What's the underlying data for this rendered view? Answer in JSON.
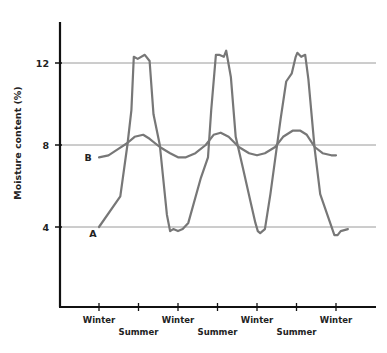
{
  "chart_data": {
    "type": "line",
    "title": "",
    "xlabel": "",
    "ylabel": "Moisture content (%)",
    "ylim": [
      0,
      14
    ],
    "yticks": [
      4,
      8,
      12
    ],
    "grid": "horizontal at y ticks",
    "x_unit": "season index (0 = Winter, 0.5 = Summer)",
    "xlim": [
      0,
      3.5
    ],
    "xticks": [
      {
        "x": 0,
        "label": "Winter",
        "row": 1
      },
      {
        "x": 0.5,
        "label": "Summer",
        "row": 2
      },
      {
        "x": 1,
        "label": "Winter",
        "row": 1
      },
      {
        "x": 1.5,
        "label": "Summer",
        "row": 2
      },
      {
        "x": 2,
        "label": "Winter",
        "row": 1
      },
      {
        "x": 2.5,
        "label": "Summer",
        "row": 2
      },
      {
        "x": 3,
        "label": "Winter",
        "row": 1
      }
    ],
    "series": [
      {
        "name": "A",
        "color": "#777777",
        "points": [
          [
            0.0,
            4.0
          ],
          [
            0.27,
            5.5
          ],
          [
            0.36,
            8.0
          ],
          [
            0.41,
            9.7
          ],
          [
            0.44,
            12.3
          ],
          [
            0.49,
            12.2
          ],
          [
            0.58,
            12.4
          ],
          [
            0.64,
            12.1
          ],
          [
            0.69,
            9.5
          ],
          [
            0.77,
            8.0
          ],
          [
            0.86,
            4.6
          ],
          [
            0.9,
            3.8
          ],
          [
            0.94,
            3.9
          ],
          [
            1.0,
            3.8
          ],
          [
            1.06,
            3.9
          ],
          [
            1.13,
            4.2
          ],
          [
            1.29,
            6.4
          ],
          [
            1.38,
            7.4
          ],
          [
            1.42,
            9.7
          ],
          [
            1.48,
            12.4
          ],
          [
            1.52,
            12.4
          ],
          [
            1.58,
            12.3
          ],
          [
            1.61,
            12.6
          ],
          [
            1.67,
            11.3
          ],
          [
            1.73,
            8.4
          ],
          [
            1.82,
            6.9
          ],
          [
            1.92,
            5.2
          ],
          [
            1.98,
            4.2
          ],
          [
            2.01,
            3.8
          ],
          [
            2.04,
            3.7
          ],
          [
            2.1,
            3.9
          ],
          [
            2.17,
            5.6
          ],
          [
            2.3,
            9.3
          ],
          [
            2.37,
            11.1
          ],
          [
            2.44,
            11.5
          ],
          [
            2.49,
            12.3
          ],
          [
            2.51,
            12.5
          ],
          [
            2.56,
            12.3
          ],
          [
            2.61,
            12.4
          ],
          [
            2.65,
            11.2
          ],
          [
            2.73,
            7.8
          ],
          [
            2.8,
            5.6
          ],
          [
            2.89,
            4.6
          ],
          [
            2.98,
            3.6
          ],
          [
            3.02,
            3.6
          ],
          [
            3.06,
            3.8
          ],
          [
            3.15,
            3.9
          ]
        ]
      },
      {
        "name": "B",
        "color": "#777777",
        "points": [
          [
            0.0,
            7.4
          ],
          [
            0.12,
            7.5
          ],
          [
            0.24,
            7.8
          ],
          [
            0.36,
            8.1
          ],
          [
            0.45,
            8.4
          ],
          [
            0.56,
            8.5
          ],
          [
            0.64,
            8.3
          ],
          [
            0.77,
            7.9
          ],
          [
            0.9,
            7.6
          ],
          [
            1.0,
            7.4
          ],
          [
            1.1,
            7.4
          ],
          [
            1.22,
            7.6
          ],
          [
            1.35,
            8.0
          ],
          [
            1.45,
            8.5
          ],
          [
            1.54,
            8.6
          ],
          [
            1.64,
            8.4
          ],
          [
            1.77,
            7.9
          ],
          [
            1.9,
            7.6
          ],
          [
            2.0,
            7.5
          ],
          [
            2.1,
            7.6
          ],
          [
            2.23,
            7.9
          ],
          [
            2.33,
            8.4
          ],
          [
            2.45,
            8.7
          ],
          [
            2.55,
            8.7
          ],
          [
            2.63,
            8.5
          ],
          [
            2.73,
            7.9
          ],
          [
            2.83,
            7.6
          ],
          [
            2.94,
            7.5
          ],
          [
            3.0,
            7.5
          ]
        ]
      }
    ],
    "annotations": [
      {
        "text": "A",
        "series": "A"
      },
      {
        "text": "B",
        "series": "B"
      }
    ]
  }
}
